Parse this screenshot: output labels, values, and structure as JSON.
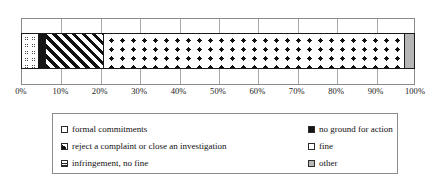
{
  "chart_data": {
    "type": "bar",
    "orientation": "horizontal-stacked",
    "title": "",
    "xlabel": "",
    "ylabel": "",
    "xlim": [
      0,
      100
    ],
    "grid": true,
    "legend_position": "bottom",
    "categories": [
      ""
    ],
    "series": [
      {
        "name": "fine",
        "values": [
          4.1
        ],
        "pattern": "small-open-circles",
        "color": "#ffffff"
      },
      {
        "name": "no ground for action",
        "values": [
          1.8
        ],
        "pattern": "solid",
        "color": "#151515"
      },
      {
        "name": "reject a complaint or close an investigation",
        "values": [
          14.7
        ],
        "pattern": "diagonal-stripes",
        "color": "#ffffff"
      },
      {
        "name": "infringement, no fine",
        "values": [
          76.9
        ],
        "pattern": "polka-dots",
        "color": "#ffffff"
      },
      {
        "name": "other",
        "values": [
          2.5
        ],
        "pattern": "flat-gray",
        "color": "#b5b5b5"
      }
    ],
    "xticks": [
      0,
      10,
      20,
      30,
      40,
      50,
      60,
      70,
      80,
      90,
      100
    ],
    "xtick_labels": [
      "0%",
      "10%",
      "20%",
      "30%",
      "40%",
      "50%",
      "60%",
      "70%",
      "80%",
      "90%",
      "100%"
    ]
  },
  "legend": {
    "left_column": [
      {
        "label": "formal commitments",
        "swatch": "legend-swatch-formal-commitments"
      },
      {
        "label": "reject a complaint or close an investigation",
        "swatch": "legend-swatch-reject-complaint"
      },
      {
        "label": "infringement, no fine",
        "swatch": "legend-swatch-infringement-no-fine"
      }
    ],
    "right_column": [
      {
        "label": "no ground for action",
        "swatch": "legend-swatch-no-ground-for-action"
      },
      {
        "label": "fine",
        "swatch": "legend-swatch-fine"
      },
      {
        "label": "other",
        "swatch": "legend-swatch-other"
      }
    ]
  }
}
